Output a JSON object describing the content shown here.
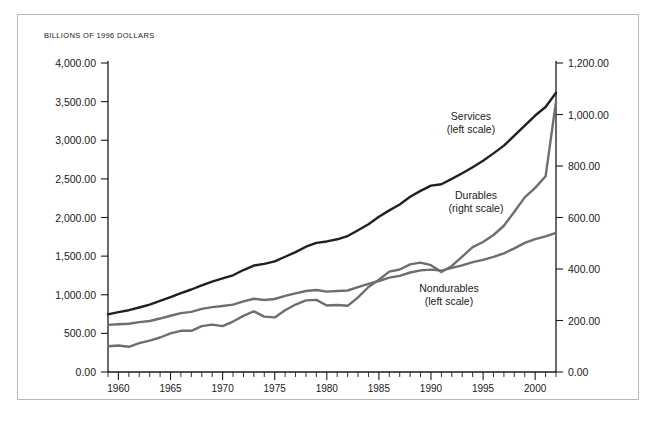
{
  "chart_data": {
    "type": "line",
    "title": "BILLIONS OF 1996 DOLLARS",
    "xlabel": "",
    "ylabel": "",
    "grid": false,
    "legend_position": "inline-annotations",
    "xlim": [
      1959,
      2002
    ],
    "x_tick_labels": [
      "1960",
      "1965",
      "1970",
      "1975",
      "1980",
      "1985",
      "1990",
      "1995",
      "2000"
    ],
    "x_tick_values": [
      1960,
      1965,
      1970,
      1975,
      1980,
      1985,
      1990,
      1995,
      2000
    ],
    "x_minor_tick_step": 1,
    "left_axis": {
      "label": "BILLIONS OF 1996 DOLLARS",
      "ylim": [
        0,
        4000
      ],
      "tick_values": [
        0,
        500,
        1000,
        1500,
        2000,
        2500,
        3000,
        3500,
        4000
      ],
      "tick_labels": [
        "0.00",
        "500.00",
        "1,000.00",
        "1,500.00",
        "2,000.00",
        "2,500.00",
        "3,000.00",
        "3,500.00",
        "4,000.00"
      ]
    },
    "right_axis": {
      "ylim": [
        0,
        1200
      ],
      "tick_values": [
        0,
        200,
        400,
        600,
        800,
        1000,
        1200
      ],
      "tick_labels": [
        "0.00",
        "200.00",
        "400.00",
        "600.00",
        "800.00",
        "1,000.00",
        "1,200.00"
      ]
    },
    "x": [
      1959,
      1960,
      1961,
      1962,
      1963,
      1964,
      1965,
      1966,
      1967,
      1968,
      1969,
      1970,
      1971,
      1972,
      1973,
      1974,
      1975,
      1976,
      1977,
      1978,
      1979,
      1980,
      1981,
      1982,
      1983,
      1984,
      1985,
      1986,
      1987,
      1988,
      1989,
      1990,
      1991,
      1992,
      1993,
      1994,
      1995,
      1996,
      1997,
      1998,
      1999,
      2000,
      2001,
      2002
    ],
    "series": [
      {
        "name": "Services",
        "annotation": "Services",
        "annotation_scale": "(left scale)",
        "axis": "left",
        "color": "#231f20",
        "values": [
          745,
          775,
          800,
          835,
          872,
          920,
          968,
          1020,
          1068,
          1120,
          1170,
          1212,
          1252,
          1320,
          1378,
          1400,
          1432,
          1492,
          1552,
          1622,
          1672,
          1690,
          1718,
          1760,
          1835,
          1912,
          2010,
          2092,
          2168,
          2268,
          2345,
          2412,
          2430,
          2500,
          2572,
          2650,
          2735,
          2830,
          2930,
          3060,
          3190,
          3320,
          3430,
          3615
        ]
      },
      {
        "name": "Durables",
        "annotation": "Durables",
        "annotation_scale": "(right scale)",
        "axis": "right",
        "color": "#6d6e71",
        "values": [
          100,
          103,
          98,
          112,
          122,
          134,
          150,
          160,
          160,
          178,
          184,
          178,
          196,
          218,
          236,
          215,
          212,
          240,
          262,
          278,
          280,
          258,
          260,
          257,
          290,
          330,
          358,
          390,
          398,
          418,
          425,
          415,
          388,
          412,
          448,
          485,
          505,
          532,
          568,
          622,
          678,
          715,
          760,
          1050
        ]
      },
      {
        "name": "Nondurables",
        "annotation": "Nondurables",
        "annotation_scale": "(left scale)",
        "axis": "left",
        "color": "#6d6e71",
        "values": [
          610,
          618,
          625,
          645,
          660,
          692,
          728,
          762,
          778,
          818,
          840,
          855,
          872,
          915,
          948,
          932,
          945,
          985,
          1018,
          1048,
          1062,
          1040,
          1048,
          1055,
          1098,
          1140,
          1178,
          1222,
          1245,
          1288,
          1315,
          1325,
          1312,
          1348,
          1380,
          1422,
          1452,
          1490,
          1535,
          1600,
          1672,
          1720,
          1755,
          1800
        ]
      }
    ]
  }
}
